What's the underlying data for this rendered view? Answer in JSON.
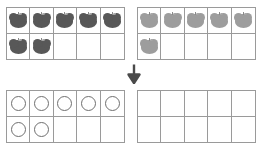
{
  "page": {
    "background_color": "#ffffff",
    "grid_line_color": "#9a9a9a"
  },
  "colors": {
    "apple_dark": "#585858",
    "apple_light": "#9d9d9d",
    "counter_outline": "#6f6f6f",
    "arrow": "#4a4a4a"
  },
  "arrow": {
    "icon": "arrow-down-icon",
    "glyph": "↓",
    "direction": "down"
  },
  "frames": [
    {
      "id": "top-left-apples",
      "position": "top-left",
      "type": "ten-frame",
      "rows": 2,
      "columns": 5,
      "token": "apple",
      "token_shade": "dark",
      "count": 7,
      "cells": [
        "apple-dark",
        "apple-dark",
        "apple-dark",
        "apple-dark",
        "apple-dark",
        "apple-dark",
        "apple-dark",
        "",
        "",
        ""
      ]
    },
    {
      "id": "top-right-apples",
      "position": "top-right",
      "type": "ten-frame",
      "rows": 2,
      "columns": 5,
      "token": "apple",
      "token_shade": "light",
      "count": 6,
      "cells": [
        "apple-light",
        "apple-light",
        "apple-light",
        "apple-light",
        "apple-light",
        "apple-light",
        "",
        "",
        "",
        ""
      ]
    },
    {
      "id": "bottom-left-counters",
      "position": "bottom-left",
      "type": "ten-frame",
      "rows": 2,
      "columns": 5,
      "token": "counter",
      "token_shade": "outline",
      "count": 7,
      "cells": [
        "counter",
        "counter",
        "counter",
        "counter",
        "counter",
        "counter",
        "counter",
        "",
        "",
        ""
      ]
    },
    {
      "id": "bottom-right-empty",
      "position": "bottom-right",
      "type": "ten-frame",
      "rows": 2,
      "columns": 5,
      "token": "none",
      "token_shade": "none",
      "count": 0,
      "cells": [
        "",
        "",
        "",
        "",
        "",
        "",
        "",
        "",
        "",
        ""
      ]
    }
  ]
}
